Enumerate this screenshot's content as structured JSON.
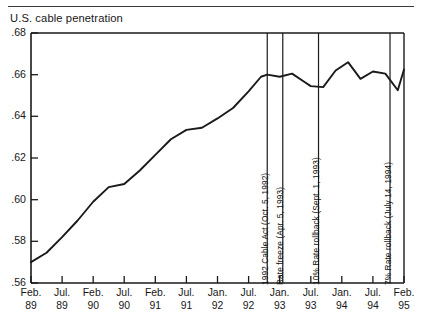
{
  "chart_title": "U.S. cable penetration",
  "chart_data": {
    "type": "line",
    "title": "U.S. cable penetration",
    "xlabel": "",
    "ylabel": "",
    "ylim": [
      0.56,
      0.68
    ],
    "yticks": [
      0.56,
      0.58,
      0.6,
      0.62,
      0.64,
      0.66,
      0.68
    ],
    "ytick_labels": [
      ".56",
      ".58",
      ".60",
      ".62",
      ".64",
      ".66",
      ".68"
    ],
    "grid": false,
    "legend": "none",
    "xtick_labels": [
      {
        "l1": "Feb.",
        "l2": "89"
      },
      {
        "l1": "Jul.",
        "l2": "89"
      },
      {
        "l1": "Feb.",
        "l2": "90"
      },
      {
        "l1": "Jul.",
        "l2": "90"
      },
      {
        "l1": "Feb.",
        "l2": "91"
      },
      {
        "l1": "Jul.",
        "l2": "91"
      },
      {
        "l1": "Jan.",
        "l2": "92"
      },
      {
        "l1": "Jul.",
        "l2": "92"
      },
      {
        "l1": "Jan.",
        "l2": "93"
      },
      {
        "l1": "Jul.",
        "l2": "93"
      },
      {
        "l1": "Jan.",
        "l2": "94"
      },
      {
        "l1": "Jul.",
        "l2": "94"
      },
      {
        "l1": "Feb.",
        "l2": "95"
      }
    ],
    "x": [
      0.0,
      0.5,
      1.0,
      1.5,
      2.0,
      2.5,
      3.0,
      3.5,
      4.0,
      4.5,
      5.0,
      5.5,
      6.0,
      6.5,
      7.0,
      7.4,
      7.6,
      8.0,
      8.4,
      8.8,
      9.0,
      9.4,
      9.8,
      10.2,
      10.6,
      11.0,
      11.4,
      11.8,
      12.0
    ],
    "values": [
      0.57,
      0.5745,
      0.582,
      0.59,
      0.599,
      0.606,
      0.6075,
      0.614,
      0.6215,
      0.629,
      0.6335,
      0.6345,
      0.639,
      0.644,
      0.652,
      0.659,
      0.66,
      0.659,
      0.6605,
      0.6565,
      0.6545,
      0.654,
      0.662,
      0.666,
      0.658,
      0.6615,
      0.6605,
      0.6525,
      0.6625
    ],
    "series": [
      {
        "name": "U.S. cable penetration",
        "color": "#1a1a1a",
        "values": [
          0.57,
          0.5745,
          0.582,
          0.59,
          0.599,
          0.606,
          0.6075,
          0.614,
          0.6215,
          0.629,
          0.6335,
          0.6345,
          0.639,
          0.644,
          0.652,
          0.659,
          0.66,
          0.659,
          0.6605,
          0.6565,
          0.6545,
          0.654,
          0.662,
          0.666,
          0.658,
          0.6615,
          0.6605,
          0.6525,
          0.6625
        ]
      }
    ],
    "annotations": [
      {
        "label": "1992 Cable Act (Oct. 5, 1992)",
        "x": 7.6
      },
      {
        "label": "Rate freeze (Apr. 5, 1993)",
        "x": 8.1
      },
      {
        "label": "10% Rate rollback (Sept. 1, 1993)",
        "x": 9.25
      },
      {
        "label": "7% Rate rollback (July 14, 1994)",
        "x": 11.55
      }
    ]
  }
}
